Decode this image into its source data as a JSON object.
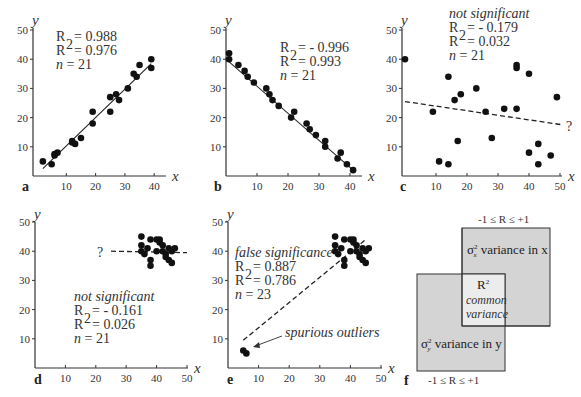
{
  "chart_data": [
    {
      "panel": "a",
      "type": "scatter",
      "xlabel": "x",
      "ylabel": "y",
      "xlim": [
        0,
        42
      ],
      "ylim": [
        0,
        50
      ],
      "xticks": [
        10,
        20,
        30,
        40
      ],
      "yticks": [
        10,
        20,
        30,
        40,
        50
      ],
      "stats": {
        "R": "= 0.988",
        "R2": "= 0.976",
        "n": "= 21"
      },
      "annotation": "",
      "fit_line": {
        "style": "solid",
        "x": [
          2,
          39
        ],
        "y": [
          2.5,
          38.5
        ]
      },
      "points": [
        [
          2,
          5
        ],
        [
          5,
          4
        ],
        [
          6,
          7
        ],
        [
          7,
          8
        ],
        [
          12,
          12
        ],
        [
          13,
          11
        ],
        [
          15,
          13
        ],
        [
          19,
          18
        ],
        [
          19,
          22
        ],
        [
          25,
          22
        ],
        [
          25,
          27
        ],
        [
          27,
          28
        ],
        [
          28,
          26
        ],
        [
          31,
          30
        ],
        [
          33,
          35
        ],
        [
          34,
          34
        ],
        [
          35,
          38
        ],
        [
          39,
          40
        ],
        [
          39,
          37
        ],
        [
          6,
          7.5
        ],
        [
          12,
          11.5
        ]
      ]
    },
    {
      "panel": "b",
      "type": "scatter",
      "xlabel": "x",
      "ylabel": "y",
      "xlim": [
        0,
        45
      ],
      "ylim": [
        0,
        50
      ],
      "xticks": [
        10,
        20,
        30,
        40
      ],
      "yticks": [
        10,
        20,
        30,
        40,
        50
      ],
      "stats": {
        "R": "= - 0.996",
        "R2": "=  0.993",
        "n": "= 21"
      },
      "annotation": "",
      "fit_line": {
        "style": "solid",
        "x": [
          0,
          41
        ],
        "y": [
          40,
          2
        ]
      },
      "points": [
        [
          1,
          42
        ],
        [
          1,
          40
        ],
        [
          4,
          38
        ],
        [
          6,
          36
        ],
        [
          7,
          34
        ],
        [
          9,
          32
        ],
        [
          13,
          30
        ],
        [
          14,
          28
        ],
        [
          15,
          26
        ],
        [
          17,
          24
        ],
        [
          21,
          20
        ],
        [
          22,
          22
        ],
        [
          26,
          18
        ],
        [
          27,
          16
        ],
        [
          29,
          14
        ],
        [
          32,
          12
        ],
        [
          32,
          10
        ],
        [
          36,
          6
        ],
        [
          37,
          8
        ],
        [
          39,
          4
        ],
        [
          41,
          2
        ]
      ]
    },
    {
      "panel": "c",
      "type": "scatter",
      "xlabel": "x",
      "ylabel": "y",
      "xlim": [
        0,
        52
      ],
      "ylim": [
        0,
        50
      ],
      "xticks": [
        10,
        20,
        30,
        40,
        50
      ],
      "yticks": [
        10,
        20,
        30,
        40,
        50
      ],
      "stats": {
        "R": "= - 0.179",
        "R2": "=   0.032",
        "n": "= 21"
      },
      "annotation": "not significant",
      "fit_line": {
        "style": "dashed",
        "x": [
          0,
          51
        ],
        "y": [
          25.5,
          17.5
        ],
        "label": "?"
      },
      "points": [
        [
          0,
          40
        ],
        [
          9,
          22
        ],
        [
          11,
          5
        ],
        [
          14,
          34
        ],
        [
          14,
          4
        ],
        [
          16,
          26
        ],
        [
          17,
          12
        ],
        [
          18,
          28
        ],
        [
          23,
          30
        ],
        [
          26,
          22
        ],
        [
          28,
          13
        ],
        [
          32,
          23
        ],
        [
          36,
          38
        ],
        [
          36,
          37
        ],
        [
          36,
          23
        ],
        [
          40,
          35
        ],
        [
          40,
          8
        ],
        [
          43,
          11
        ],
        [
          43,
          4
        ],
        [
          47,
          7
        ],
        [
          49,
          27
        ]
      ]
    },
    {
      "panel": "d",
      "type": "scatter",
      "xlabel": "x",
      "ylabel": "y",
      "xlim": [
        0,
        50
      ],
      "ylim": [
        0,
        50
      ],
      "xticks": [
        10,
        20,
        30,
        40,
        50
      ],
      "yticks": [
        10,
        20,
        30,
        40,
        50
      ],
      "stats": {
        "R": "= - 0.161",
        "R2": "=   0.026",
        "n": "= 21"
      },
      "annotation": "not significant",
      "fit_line": {
        "style": "dashed",
        "x": [
          25,
          50
        ],
        "y": [
          40,
          39.5
        ],
        "label": "?"
      },
      "points": [
        [
          35,
          45
        ],
        [
          35,
          42
        ],
        [
          35,
          40
        ],
        [
          36,
          39
        ],
        [
          37,
          41
        ],
        [
          38,
          37
        ],
        [
          38,
          35
        ],
        [
          38,
          44
        ],
        [
          40,
          44
        ],
        [
          41,
          44
        ],
        [
          41,
          43
        ],
        [
          42,
          42
        ],
        [
          42,
          40
        ],
        [
          43,
          39
        ],
        [
          43,
          38
        ],
        [
          44,
          41
        ],
        [
          44,
          37
        ],
        [
          45,
          40
        ],
        [
          45,
          36
        ],
        [
          46,
          41
        ],
        [
          40,
          40
        ]
      ]
    },
    {
      "panel": "e",
      "type": "scatter",
      "xlabel": "x",
      "ylabel": "y",
      "xlim": [
        0,
        50
      ],
      "ylim": [
        0,
        50
      ],
      "xticks": [
        10,
        20,
        30,
        40,
        50
      ],
      "yticks": [
        10,
        20,
        30,
        40,
        50
      ],
      "stats": {
        "R": "= 0.887",
        "R2": "= 0.786",
        "n": "= 23"
      },
      "annotation": "false significance",
      "annotation2": "spurious outliers",
      "fit_line": {
        "style": "dashed",
        "x": [
          5,
          45
        ],
        "y": [
          9.5,
          44
        ]
      },
      "points": [
        [
          5,
          6
        ],
        [
          6,
          5
        ],
        [
          35,
          45
        ],
        [
          35,
          42
        ],
        [
          35,
          40
        ],
        [
          36,
          39
        ],
        [
          37,
          41
        ],
        [
          38,
          37
        ],
        [
          38,
          35
        ],
        [
          38,
          44
        ],
        [
          40,
          44
        ],
        [
          41,
          44
        ],
        [
          41,
          43
        ],
        [
          42,
          42
        ],
        [
          42,
          40
        ],
        [
          43,
          39
        ],
        [
          43,
          38
        ],
        [
          44,
          41
        ],
        [
          44,
          37
        ],
        [
          45,
          40
        ],
        [
          45,
          36
        ],
        [
          46,
          41
        ],
        [
          40,
          40
        ]
      ]
    }
  ],
  "diagram_f": {
    "panel": "f",
    "top_range": "-1 ≤ R ≤ +1",
    "bottom_range": "-1 ≤ R ≤ +1",
    "box_x_label": "variance in x",
    "box_x_sigma": "σ",
    "box_x_sub": "x",
    "box_y_label": "variance in y",
    "box_y_sigma": "σ",
    "box_y_sub": "y",
    "overlap_title": "R",
    "overlap_line1": "common",
    "overlap_line2": "variance",
    "colors": {
      "box_fill": "#d4d4d4",
      "overlap_fill": "#ececec",
      "border": "#333333"
    }
  },
  "labels": {
    "x": "x",
    "y": "y",
    "panels": [
      "a",
      "b",
      "c",
      "d",
      "e",
      "f"
    ],
    "R": "R",
    "R2": "R",
    "n": "n",
    "sup2": "2",
    "question": "?"
  }
}
